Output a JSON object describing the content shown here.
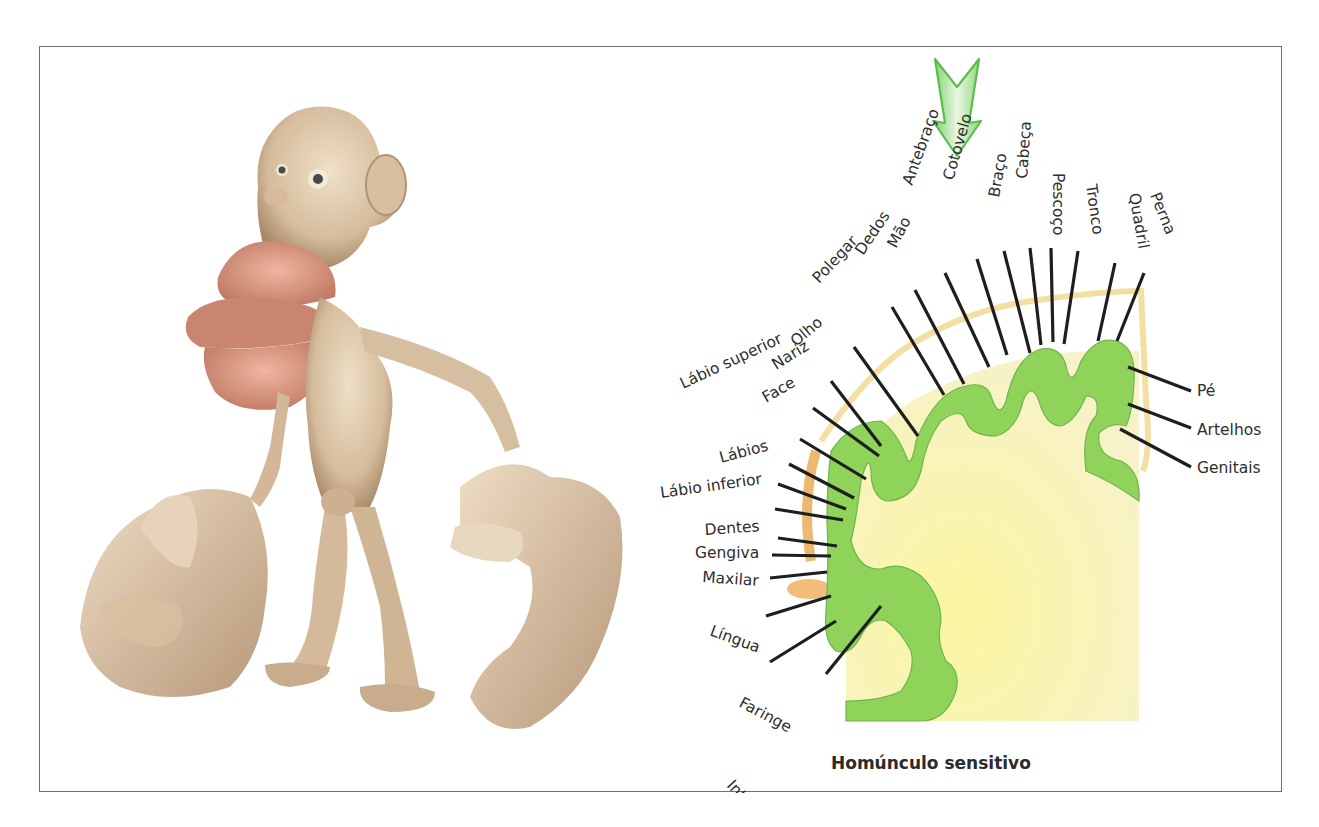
{
  "figure": {
    "left_panel": {
      "description": "Sculpture of the sensory homunculus",
      "colors": {
        "skin": "#d9c2a3",
        "skin_shadow": "#a98b6b",
        "lips": "#d9957f",
        "tongue": "#c98570"
      }
    },
    "right_panel": {
      "caption": "Homúnculo sensitivo",
      "arrow": {
        "color": "#5cbf4a",
        "fill_light": "#e6f6df"
      },
      "colors": {
        "cortex_green": "#8fd35b",
        "white_matter": "#f7f3a8",
        "vessels": "#e3a64a",
        "line": "#1e1e1e"
      },
      "labels": [
        {
          "text": "Perna",
          "x": 1149,
          "y": 194,
          "rot": 68,
          "lx1": 1143,
          "ly1": 272,
          "lx2": 1116,
          "ly2": 340
        },
        {
          "text": "Quadril",
          "x": 1128,
          "y": 193,
          "rot": 80,
          "lx1": 1114,
          "ly1": 262,
          "lx2": 1097,
          "ly2": 340
        },
        {
          "text": "Tronco",
          "x": 1085,
          "y": 184,
          "rot": 82,
          "lx1": 1077,
          "ly1": 250,
          "lx2": 1063,
          "ly2": 343
        },
        {
          "text": "Pescoço",
          "x": 1052,
          "y": 172,
          "rot": 90,
          "lx1": 1050,
          "ly1": 247,
          "lx2": 1052,
          "ly2": 341
        },
        {
          "text": "Cabeça",
          "x": 1026,
          "y": 178,
          "rot": 94,
          "lx1": 1029,
          "ly1": 247,
          "lx2": 1040,
          "ly2": 344
        },
        {
          "text": "Braço",
          "x": 998,
          "y": 197,
          "rot": 100,
          "lx1": 1003,
          "ly1": 250,
          "lx2": 1029,
          "ly2": 352
        },
        {
          "text": "Cotovelo",
          "x": 952,
          "y": 180,
          "rot": 106,
          "lx1": 976,
          "ly1": 258,
          "lx2": 1006,
          "ly2": 354
        },
        {
          "text": "Antebraço",
          "x": 911,
          "y": 185,
          "rot": 110,
          "lx1": 944,
          "ly1": 272,
          "lx2": 988,
          "ly2": 366
        },
        {
          "text": "Mão",
          "x": 895,
          "y": 248,
          "rot": 118,
          "lx1": 914,
          "ly1": 289,
          "lx2": 963,
          "ly2": 383
        },
        {
          "text": "Dedos",
          "x": 862,
          "y": 255,
          "rot": 124,
          "lx1": 891,
          "ly1": 306,
          "lx2": 943,
          "ly2": 394
        },
        {
          "text": "Polegar",
          "x": 818,
          "y": 283,
          "rot": 133,
          "lx1": 853,
          "ly1": 346,
          "lx2": 917,
          "ly2": 435
        },
        {
          "text": "Olho",
          "x": 795,
          "y": 346,
          "rot": 140,
          "lx1": 830,
          "ly1": 380,
          "lx2": 880,
          "ly2": 445
        },
        {
          "text": "Nariz",
          "x": 775,
          "y": 369,
          "rot": 148,
          "lx1": 812,
          "ly1": 407,
          "lx2": 878,
          "ly2": 455
        },
        {
          "text": "Face",
          "x": 765,
          "y": 402,
          "rot": 150,
          "lx1": 799,
          "ly1": 438,
          "lx2": 865,
          "ly2": 478
        },
        {
          "text": "Lábio superior",
          "x": 682,
          "y": 388,
          "rot": 155,
          "lx1": 788,
          "ly1": 463,
          "lx2": 853,
          "ly2": 497
        },
        {
          "text": "Lábios",
          "x": 720,
          "y": 462,
          "rot": 165,
          "lx1": 777,
          "ly1": 483,
          "lx2": 845,
          "ly2": 508
        },
        {
          "text": "Lábio inferior",
          "x": 660,
          "y": 497,
          "rot": 172,
          "lx1": 774,
          "ly1": 508,
          "lx2": 842,
          "ly2": 519
        },
        {
          "text": "Dentes",
          "x": 704,
          "y": 534,
          "rot": 176,
          "lx1": 777,
          "ly1": 537,
          "lx2": 836,
          "ly2": 545
        },
        {
          "text": "Gengiva",
          "x": 694,
          "y": 557,
          "rot": 180,
          "lx1": 771,
          "ly1": 554,
          "lx2": 830,
          "ly2": 555
        },
        {
          "text": "Maxilar",
          "x": 701,
          "y": 581,
          "rot": 184,
          "lx1": 769,
          "ly1": 577,
          "lx2": 826,
          "ly2": 571
        },
        {
          "text": "Língua",
          "x": 708,
          "y": 634,
          "rot": 200,
          "lx1": 765,
          "ly1": 615,
          "lx2": 830,
          "ly2": 595
        },
        {
          "text": "Faringe",
          "x": 737,
          "y": 705,
          "rot": 208,
          "lx1": 769,
          "ly1": 661,
          "lx2": 835,
          "ly2": 620
        },
        {
          "text": "Intra-abdominal",
          "x": 725,
          "y": 785,
          "rot": 227,
          "lx1": 825,
          "ly1": 673,
          "lx2": 880,
          "ly2": 605
        },
        {
          "text": "Pé",
          "x": 1196,
          "y": 395,
          "rot": 0,
          "lx1": 1190,
          "ly1": 390,
          "lx2": 1127,
          "ly2": 366
        },
        {
          "text": "Artelhos",
          "x": 1196,
          "y": 434,
          "rot": 0,
          "lx1": 1190,
          "ly1": 427,
          "lx2": 1127,
          "ly2": 403
        },
        {
          "text": "Genitais",
          "x": 1196,
          "y": 472,
          "rot": 0,
          "lx1": 1190,
          "ly1": 466,
          "lx2": 1119,
          "ly2": 428
        }
      ]
    }
  }
}
